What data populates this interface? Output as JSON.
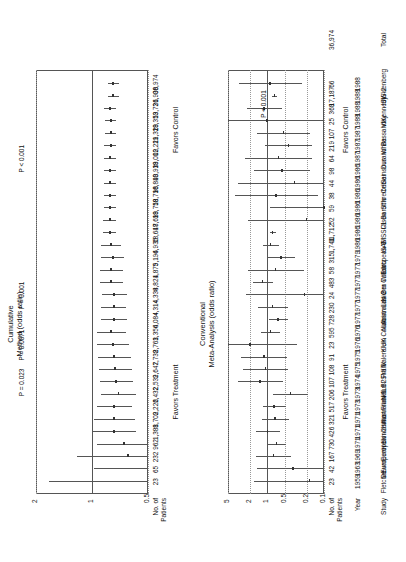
{
  "figure": {
    "top_panel": {
      "title_line1": "Cumulative",
      "title_line2": "Method (odds ratio)",
      "axis_ticks": [
        "0.5",
        "1",
        "2"
      ],
      "axis_values": [
        0.5,
        1,
        2
      ],
      "column_header_line1": "No. of",
      "column_header_line2": "Patients",
      "favors_left": "Favors Treatment",
      "favors_right": "Favors Control"
    },
    "bottom_panel": {
      "title_line1": "Conventional",
      "title_line2": "Meta-Analysis (odds ratio)",
      "axis_ticks": [
        "0.1",
        "0.2",
        "0.5",
        "1",
        "2",
        "5"
      ],
      "axis_values": [
        0.1,
        0.2,
        0.5,
        1,
        2,
        5
      ],
      "column_header_study": "Study",
      "column_header_year": "Year",
      "column_header_line1": "No. of",
      "column_header_line2": "Patients",
      "favors_left": "Favors Treatment",
      "favors_right": "Favors Control",
      "total_label": "Total",
      "total_patients": "36,974",
      "overall_p": "P < 0.001"
    },
    "pvalue_annotations": [
      {
        "text": "P = 0.023",
        "row": 8
      },
      {
        "text": "P = 0.0071",
        "row": 11
      },
      {
        "text": "P = 0.001",
        "row": 15
      },
      {
        "text": "P < 0.001",
        "row": 26
      }
    ]
  },
  "chart_data": {
    "type": "forest",
    "xlabel": "Odds ratio",
    "xscale": "log",
    "conventional_xlim": [
      0.1,
      5
    ],
    "cumulative_xlim": [
      0.5,
      2
    ],
    "grid": true,
    "null_value": 1,
    "columns": [
      "Study",
      "Year",
      "No. of Patients (conventional)",
      "No. of Patients (cumulative)"
    ],
    "rows": [
      {
        "study": "Fletcher",
        "year": 1959,
        "n": "23",
        "cum_n": "23",
        "or": 0.18,
        "lo": 0.02,
        "hi": 1.7,
        "cum_or": 0.18,
        "cum_lo": 0.02,
        "cum_hi": 1.7
      },
      {
        "study": "Dewar",
        "year": 1963,
        "n": "42",
        "cum_n": "65",
        "or": 0.35,
        "lo": 0.08,
        "hi": 1.55,
        "cum_or": 0.28,
        "cum_lo": 0.08,
        "cum_hi": 0.98
      },
      {
        "study": "European 1",
        "year": 1969,
        "n": "167",
        "cum_n": "232",
        "or": 0.78,
        "lo": 0.38,
        "hi": 1.6,
        "cum_or": 0.64,
        "cum_lo": 0.34,
        "cum_hi": 1.21
      },
      {
        "study": "European 2",
        "year": 1971,
        "n": "730",
        "cum_n": "962",
        "or": 0.68,
        "lo": 0.47,
        "hi": 0.99,
        "cum_or": 0.67,
        "cum_lo": 0.48,
        "cum_hi": 0.94
      },
      {
        "study": "Heikinheimo",
        "year": 1971,
        "n": "426",
        "cum_n": "1,388",
        "or": 0.99,
        "lo": 0.61,
        "hi": 1.61,
        "cum_or": 0.76,
        "cum_lo": 0.58,
        "cum_hi": 1.0
      },
      {
        "study": "Italian",
        "year": 1971,
        "n": "321",
        "cum_n": "1,709",
        "or": 0.73,
        "lo": 0.42,
        "hi": 1.27,
        "cum_or": 0.76,
        "cum_lo": 0.59,
        "cum_hi": 0.97
      },
      {
        "study": "Australian 1",
        "year": 1973,
        "n": "517",
        "cum_n": "2,226",
        "or": 0.76,
        "lo": 0.47,
        "hi": 1.22,
        "cum_or": 0.76,
        "cum_lo": 0.61,
        "cum_hi": 0.94
      },
      {
        "study": "Frankfurt 2",
        "year": 1973,
        "n": "206",
        "cum_n": "2,432",
        "or": 0.39,
        "lo": 0.19,
        "hi": 0.79,
        "cum_or": 0.72,
        "cum_lo": 0.58,
        "cum_hi": 0.89
      },
      {
        "study": "NHLBI SMIT",
        "year": 1974,
        "n": "107",
        "cum_n": "2,539",
        "or": 1.33,
        "lo": 0.53,
        "hi": 3.38,
        "cum_or": 0.74,
        "cum_lo": 0.6,
        "cum_hi": 0.91
      },
      {
        "study": "Frank",
        "year": 1975,
        "n": "108",
        "cum_n": "2,647",
        "or": 1.08,
        "lo": 0.43,
        "hi": 2.7,
        "cum_or": 0.75,
        "cum_lo": 0.61,
        "cum_hi": 0.92
      },
      {
        "study": "Valere",
        "year": 1975,
        "n": "91",
        "cum_n": "2,738",
        "or": 1.15,
        "lo": 0.45,
        "hi": 2.95,
        "cum_or": 0.76,
        "cum_lo": 0.62,
        "cum_hi": 0.93
      },
      {
        "study": "Klein",
        "year": 1976,
        "n": "23",
        "cum_n": "2,761",
        "or": 2.0,
        "lo": 0.3,
        "hi": 13.0,
        "cum_or": 0.77,
        "cum_lo": 0.63,
        "cum_hi": 0.94
      },
      {
        "study": "UK Collab",
        "year": 1976,
        "n": "595",
        "cum_n": "3,356",
        "or": 0.88,
        "lo": 0.59,
        "hi": 1.3,
        "cum_or": 0.79,
        "cum_lo": 0.66,
        "cum_hi": 0.94
      },
      {
        "study": "Austrian",
        "year": 1977,
        "n": "728",
        "cum_n": "4,084",
        "or": 0.64,
        "lo": 0.44,
        "hi": 0.94,
        "cum_or": 0.76,
        "cum_lo": 0.65,
        "cum_hi": 0.89
      },
      {
        "study": "Australian 2",
        "year": 1977,
        "n": "230",
        "cum_n": "4,314",
        "or": 0.8,
        "lo": 0.43,
        "hi": 1.5,
        "cum_or": 0.76,
        "cum_lo": 0.66,
        "cum_hi": 0.89
      },
      {
        "study": "Lasierra",
        "year": 1977,
        "n": "24",
        "cum_n": "4,338",
        "or": 0.22,
        "lo": 0.02,
        "hi": 2.4,
        "cum_or": 0.76,
        "cum_lo": 0.65,
        "cum_hi": 0.88
      },
      {
        "study": "N Ger Collab",
        "year": 1977,
        "n": "483",
        "cum_n": "4,821",
        "or": 1.21,
        "lo": 0.8,
        "hi": 1.82,
        "cum_or": 0.79,
        "cum_lo": 0.68,
        "cum_hi": 0.91
      },
      {
        "study": "Witchitz",
        "year": 1977,
        "n": "58",
        "cum_n": "4,879",
        "or": 0.71,
        "lo": 0.23,
        "hi": 2.25,
        "cum_or": 0.79,
        "cum_lo": 0.68,
        "cum_hi": 0.91
      },
      {
        "study": "European 3",
        "year": 1979,
        "n": "315",
        "cum_n": "5,194",
        "or": 0.57,
        "lo": 0.33,
        "hi": 0.98,
        "cum_or": 0.77,
        "cum_lo": 0.67,
        "cum_hi": 0.89
      },
      {
        "study": "ISAM",
        "year": 1986,
        "n": "1,741",
        "cum_n": "6,935",
        "or": 0.88,
        "lo": 0.63,
        "hi": 1.22,
        "cum_or": 0.79,
        "cum_lo": 0.7,
        "cum_hi": 0.89
      },
      {
        "study": "GISSI-1",
        "year": 1986,
        "n": "11,712",
        "cum_n": "18,647",
        "or": 0.81,
        "lo": 0.72,
        "hi": 0.91,
        "cum_or": 0.8,
        "cum_lo": 0.74,
        "cum_hi": 0.87
      },
      {
        "study": "Olson",
        "year": 1986,
        "n": "52",
        "cum_n": "18,699",
        "or": 0.2,
        "lo": 0.02,
        "hi": 2.2,
        "cum_or": 0.8,
        "cum_lo": 0.74,
        "cum_hi": 0.87
      },
      {
        "study": "Baroffio",
        "year": 1986,
        "n": "59",
        "cum_n": "18,758",
        "or": 0.1,
        "lo": 0.01,
        "hi": 0.9,
        "cum_or": 0.8,
        "cum_lo": 0.74,
        "cum_hi": 0.86
      },
      {
        "study": "Schreiber",
        "year": 1986,
        "n": "38",
        "cum_n": "18,796",
        "or": 0.7,
        "lo": 0.13,
        "hi": 3.7,
        "cum_or": 0.8,
        "cum_lo": 0.74,
        "cum_hi": 0.86
      },
      {
        "study": "Cribier",
        "year": 1986,
        "n": "44",
        "cum_n": "18,840",
        "or": 0.33,
        "lo": 0.03,
        "hi": 3.3,
        "cum_or": 0.8,
        "cum_lo": 0.74,
        "cum_hi": 0.86
      },
      {
        "study": "Sainsous",
        "year": 1986,
        "n": "98",
        "cum_n": "18,938",
        "or": 0.55,
        "lo": 0.18,
        "hi": 1.7,
        "cum_or": 0.8,
        "cum_lo": 0.74,
        "cum_hi": 0.86
      },
      {
        "study": "Durand",
        "year": 1987,
        "n": "64",
        "cum_n": "19,002",
        "or": 0.63,
        "lo": 0.16,
        "hi": 2.5,
        "cum_or": 0.8,
        "cum_lo": 0.74,
        "cum_hi": 0.86
      },
      {
        "study": "White",
        "year": 1987,
        "n": "219",
        "cum_n": "19,221",
        "or": 0.42,
        "lo": 0.16,
        "hi": 1.1,
        "cum_or": 0.79,
        "cum_lo": 0.74,
        "cum_hi": 0.86
      },
      {
        "study": "Bassand",
        "year": 1987,
        "n": "107",
        "cum_n": "19,328",
        "or": 0.52,
        "lo": 0.18,
        "hi": 1.55,
        "cum_or": 0.79,
        "cum_lo": 0.74,
        "cum_hi": 0.85
      },
      {
        "study": "Vlay",
        "year": 1988,
        "n": "25",
        "cum_n": "19,353",
        "or": 1.0,
        "lo": 0.06,
        "hi": 17.0,
        "cum_or": 0.79,
        "cum_lo": 0.74,
        "cum_hi": 0.85
      },
      {
        "study": "Kennedy",
        "year": 1988,
        "n": "368",
        "cum_n": "19,721",
        "or": 1.14,
        "lo": 0.56,
        "hi": 2.3,
        "cum_or": 0.8,
        "cum_lo": 0.74,
        "cum_hi": 0.86
      },
      {
        "study": "ISIS-2",
        "year": 1988,
        "n": "17,187",
        "cum_n": "36,908",
        "or": 0.75,
        "lo": 0.67,
        "hi": 0.84,
        "cum_or": 0.77,
        "cum_lo": 0.72,
        "cum_hi": 0.82
      },
      {
        "study": "Wisenberg",
        "year": 1988,
        "n": "66",
        "cum_n": "36,974",
        "or": 0.9,
        "lo": 0.25,
        "hi": 3.2,
        "cum_or": 0.77,
        "cum_lo": 0.72,
        "cum_hi": 0.82
      }
    ]
  }
}
